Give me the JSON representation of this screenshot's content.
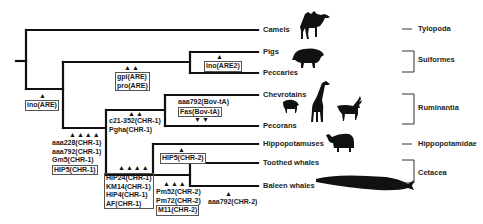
{
  "taxa": [
    {
      "name": "Camels"
    },
    {
      "name": "Pigs"
    },
    {
      "name": "Peccaries"
    },
    {
      "name": "Chevrotains"
    },
    {
      "name": "Pecorans"
    },
    {
      "name": "Hippopotamuses"
    },
    {
      "name": "Toothed whales"
    },
    {
      "name": "Baleen whales"
    }
  ],
  "groups": [
    {
      "name": "Tylopoda"
    },
    {
      "name": "Suiformes"
    },
    {
      "name": "Ruminantia"
    },
    {
      "name": "Hippopotamidae"
    },
    {
      "name": "Cetacea"
    }
  ],
  "markers": {
    "ino_are": "ino(ARE)",
    "ino_are2": "ino(ARE2)",
    "gpi_are": "gpi(ARE)",
    "pro_are": "pro(ARE)",
    "c21": "c21-352(CHR-1)",
    "pgha": "Pgha(CHR-1)",
    "aaa228": "aaa228(CHR-1)",
    "aaa792_chr1": "aaa792(CHR-1)",
    "gm5": "Gm5(CHR-1)",
    "hip5_chr1": "HIP5(CHR-1)",
    "aaa792_bov": "aaa792(Bov-tA)",
    "fas_bov": "Fas(Bov-tA)",
    "hip24": "HIP24(CHR-1)",
    "km14": "KM14(CHR-1)",
    "hip4": "HIP4(CHR-1)",
    "af": "AF(CHR-1)",
    "hip5_chr2": "HIP5(CHR-2)",
    "pm52": "Pm52(CHR-2)",
    "pm72": "Pm72(CHR-2)",
    "m11": "M11(CHR-2)",
    "aaa792_chr2": "aaa792(CHR-2)"
  },
  "arrow_glyphs": {
    "up1": "▲",
    "up2": "▲▲",
    "up3": "▲▲▲",
    "up4": "▲▲▲▲",
    "down2": "▼▼"
  },
  "colors": {
    "line": "#111111",
    "text": "#222222",
    "box_border": "#555555"
  }
}
